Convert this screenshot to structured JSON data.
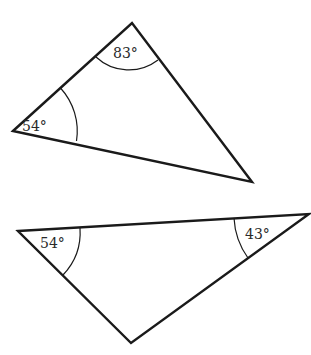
{
  "diagram": {
    "type": "geometry-triangles",
    "stroke_color": "#1a1a1a",
    "background": "#ffffff",
    "triangles": [
      {
        "id": "triangle-1",
        "vertices": {
          "left": [
            13,
            131
          ],
          "top": [
            132,
            23
          ],
          "bottom_right": [
            252,
            182
          ]
        },
        "angles": [
          {
            "vertex": "left",
            "label": "54°"
          },
          {
            "vertex": "top",
            "label": "83°"
          }
        ]
      },
      {
        "id": "triangle-2",
        "vertices": {
          "left": [
            18,
            231
          ],
          "right": [
            309,
            214
          ],
          "bottom": [
            131,
            343
          ]
        },
        "angles": [
          {
            "vertex": "left",
            "label": "54°"
          },
          {
            "vertex": "right",
            "label": "43°"
          }
        ]
      }
    ]
  }
}
